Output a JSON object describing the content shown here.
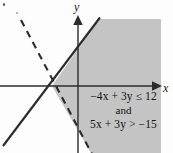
{
  "figure": {
    "type": "system-of-linear-inequalities-graph",
    "background_color": "#fdfdfd",
    "shade_color": "#c4c4c4",
    "line_color": "#2b2b2b",
    "axis_color": "#2b2b2b"
  },
  "axes": {
    "x_label": "x",
    "y_label": "y",
    "origin_px": [
      78,
      86
    ],
    "x_axis_y_px": 86,
    "y_axis_x_px": 78,
    "x_arrow_end_px": [
      160,
      86
    ],
    "y_arrow_end_px": [
      78,
      16
    ]
  },
  "boundaries": [
    {
      "name": "boundary-solid",
      "equation": "-4x + 3y = 12",
      "style": "solid",
      "included": true,
      "slope_sign": "positive",
      "from_px": [
        4,
        145
      ],
      "to_px": [
        99,
        19
      ]
    },
    {
      "name": "boundary-dashed",
      "equation": "5x + 3y = -15",
      "style": "dashed",
      "included": false,
      "slope_sign": "negative",
      "from_px": [
        22,
        22
      ],
      "to_px": [
        91,
        153
      ]
    }
  ],
  "intersection_point": {
    "graph": "(-3, 0)",
    "px": [
      52,
      86
    ]
  },
  "shaded_region": {
    "description": "solution set satisfying both inequalities",
    "fill": "#c4c4c4"
  },
  "annotation": {
    "inequality_1": {
      "lead_sign": "−",
      "term_a_coef": "4",
      "term_a_var": "x",
      "plus": "+",
      "term_b_coef": "3",
      "term_b_var": "y",
      "relation": "≤",
      "constant": "12",
      "full": "−4x + 3y ≤ 12"
    },
    "conjunction": "and",
    "inequality_2": {
      "term_a_coef": "5",
      "term_a_var": "x",
      "plus": "+",
      "term_b_coef": "3",
      "term_b_var": "y",
      "relation": ">",
      "constant": "−15",
      "full": "5x + 3y > −15"
    }
  }
}
